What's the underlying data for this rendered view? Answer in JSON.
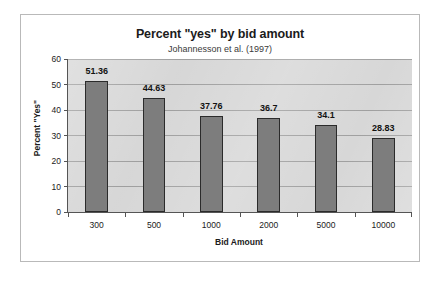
{
  "chart_data": {
    "type": "bar",
    "title": "Percent \"yes\" by bid amount",
    "subtitle": "Johannesson et al. (1997)",
    "xlabel": "Bid Amount",
    "ylabel": "Percent \"Yes\"",
    "categories": [
      "300",
      "500",
      "1000",
      "2000",
      "5000",
      "10000"
    ],
    "values": [
      51.36,
      44.63,
      37.76,
      36.7,
      34.1,
      28.83
    ],
    "value_labels": [
      "51.36",
      "44.63",
      "37.76",
      "36.7",
      "34.1",
      "28.83"
    ],
    "ylim": [
      0,
      60
    ],
    "ytick_values": [
      0,
      10,
      20,
      30,
      40,
      50,
      60
    ],
    "ytick_labels": [
      "0",
      "10",
      "20",
      "30",
      "40",
      "50",
      "60"
    ],
    "grid": "horizontal",
    "legend": "none",
    "colors": {
      "bar_fill": "#7d7d7d",
      "bar_border": "#2b2b2b",
      "plot_background": "#d6d6d6",
      "gridline": "#9d9d9d",
      "axis_line": "#555555",
      "text": "#1b1b1b",
      "frame_border": "#b9b9b9",
      "page_background": "#ffffff"
    }
  }
}
